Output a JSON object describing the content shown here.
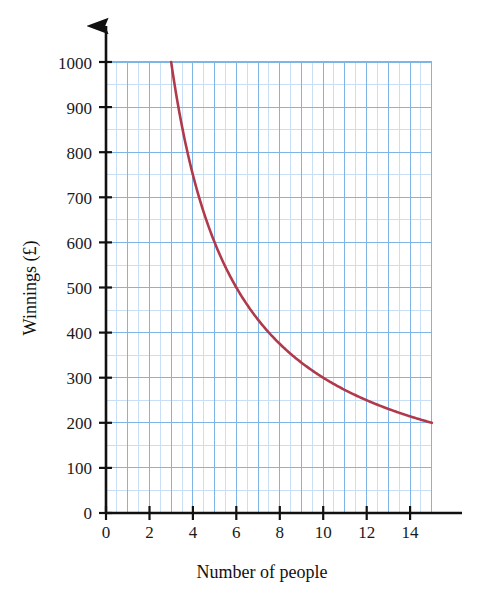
{
  "chart_data": {
    "type": "line",
    "title": "",
    "subtitle": "",
    "xlabel": "Number of people",
    "ylabel": "Winnings (£)",
    "xlim": [
      0,
      15
    ],
    "ylim": [
      0,
      1000
    ],
    "x_tick_labels": [
      "0",
      "2",
      "4",
      "6",
      "8",
      "10",
      "12",
      "14"
    ],
    "x_tick_values": [
      0,
      2,
      4,
      6,
      8,
      10,
      12,
      14
    ],
    "y_tick_labels": [
      "0",
      "100",
      "200",
      "300",
      "400",
      "500",
      "600",
      "700",
      "800",
      "900",
      "1000"
    ],
    "y_tick_values": [
      0,
      100,
      200,
      300,
      400,
      500,
      600,
      700,
      800,
      900,
      1000
    ],
    "grid": true,
    "grid_major_x_step": 1,
    "grid_major_y_step": 100,
    "grid_minor_x_step": 0.5,
    "grid_minor_y_step": 50,
    "legend": false,
    "legend_position": "none",
    "relationship": "W = 3000 / n",
    "series": [
      {
        "name": "Winnings",
        "color": "#b03a4b",
        "x": [
          3,
          3.25,
          3.5,
          3.75,
          4,
          4.25,
          4.5,
          4.75,
          5,
          5.5,
          6,
          6.5,
          7,
          7.5,
          8,
          8.5,
          9,
          9.5,
          10,
          10.5,
          11,
          11.5,
          12,
          12.5,
          13,
          13.5,
          14,
          14.5,
          15
        ],
        "values": [
          1000,
          923,
          857,
          800,
          750,
          706,
          667,
          632,
          600,
          545,
          500,
          462,
          429,
          400,
          375,
          353,
          333,
          316,
          300,
          286,
          273,
          261,
          250,
          240,
          231,
          222,
          214,
          207,
          200
        ]
      }
    ],
    "annotations": []
  },
  "axes": {
    "x_arrow": true,
    "y_arrow": true,
    "axis_color": "#111111",
    "grid_major_color": "#7fb5e6",
    "grid_minor_color": "#c5ddf4",
    "background": "#ffffff"
  }
}
